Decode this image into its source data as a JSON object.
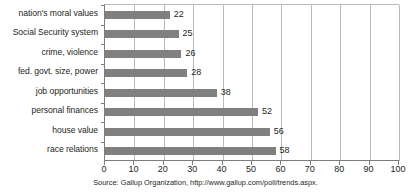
{
  "chart_data": {
    "type": "bar",
    "orientation": "horizontal",
    "title": "",
    "subtitle": "",
    "xlabel": "",
    "ylabel": "",
    "xlim": [
      0,
      100
    ],
    "xticks": [
      0,
      10,
      20,
      30,
      40,
      50,
      60,
      70,
      80,
      90,
      100
    ],
    "grid": true,
    "grid_axis": "x",
    "legend": false,
    "legend_position": "none",
    "categories": [
      "nation's moral values",
      "Social Security system",
      "crime, violence",
      "fed. govt. size, power",
      "job opportunities",
      "personal finances",
      "house value",
      "race relations"
    ],
    "values": [
      22,
      25,
      26,
      28,
      38,
      52,
      56,
      58
    ],
    "data_labels": [
      "22",
      "25",
      "26",
      "28",
      "38",
      "52",
      "56",
      "58"
    ],
    "bar_color": "#808080",
    "grid_color": "#b9b9b9",
    "axis_color": "#7d7d7d",
    "text_color": "#231f20",
    "background_color": "#ffffff"
  },
  "caption": {
    "source_note": "Source: Gallup Organization, http://www.gallup.com/poll/trends.aspx."
  }
}
